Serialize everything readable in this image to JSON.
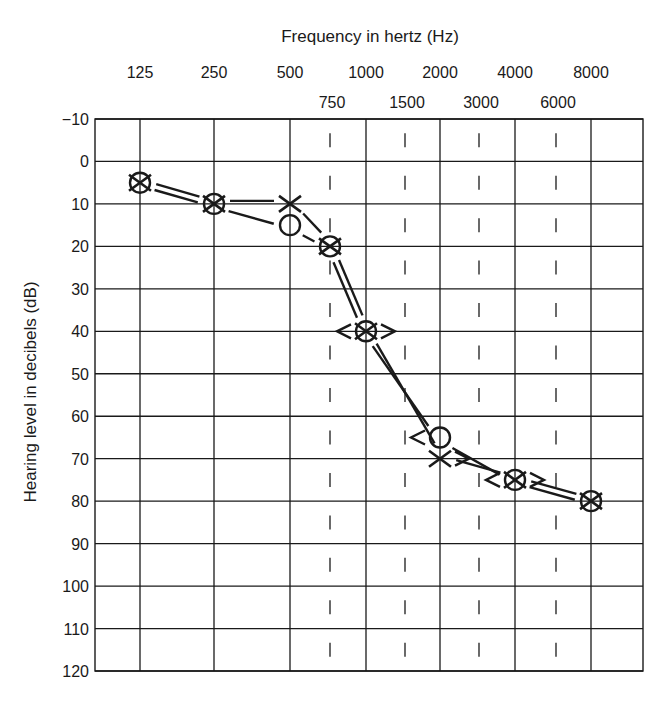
{
  "chart_data": {
    "type": "line",
    "title": "",
    "xlabel": "Frequency in hertz (Hz)",
    "ylabel": "Hearing level in decibels (dB)",
    "x_octave_ticks": [
      "125",
      "250",
      "500",
      "1000",
      "2000",
      "4000",
      "8000"
    ],
    "x_interoctave_ticks": [
      "750",
      "1500",
      "3000",
      "6000"
    ],
    "y_ticks": [
      -10,
      0,
      10,
      20,
      30,
      40,
      50,
      60,
      70,
      80,
      90,
      100,
      110,
      120
    ],
    "ylim": [
      -10,
      120
    ],
    "y_inverted": true,
    "grid": true,
    "series": [
      {
        "name": "Right ear air conduction (O)",
        "marker": "circle",
        "x": [
          125,
          250,
          500,
          750,
          1000,
          2000,
          4000,
          8000
        ],
        "values": [
          5,
          10,
          15,
          20,
          40,
          65,
          75,
          80
        ]
      },
      {
        "name": "Left ear air conduction (X)",
        "marker": "x",
        "x": [
          125,
          250,
          500,
          750,
          1000,
          2000,
          4000,
          8000
        ],
        "values": [
          5,
          10,
          10,
          20,
          40,
          70,
          75,
          80
        ]
      },
      {
        "name": "Right ear bone conduction (<)",
        "marker": "lt",
        "x": [
          1000,
          2000,
          4000
        ],
        "values": [
          40,
          65,
          75
        ]
      },
      {
        "name": "Left ear bone conduction (>)",
        "marker": "gt",
        "x": [
          1000,
          2000,
          4000
        ],
        "values": [
          40,
          70,
          75
        ]
      }
    ]
  }
}
